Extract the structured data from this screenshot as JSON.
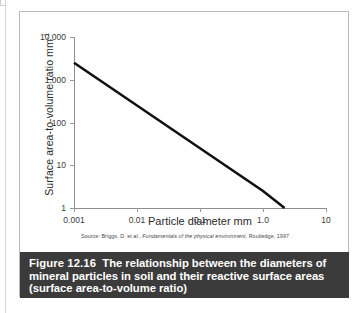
{
  "figure": {
    "caption_label": "Figure 12.16",
    "caption_text": "The relationship between the diameters of mineral particles in soil and their reactive surface areas (surface area-to-volume ratio)",
    "source_prefix": "Source: Briggs, D. et al., ",
    "source_italic": "Fundamentals of the physical environment",
    "source_suffix": ", Routledge, 1997"
  },
  "chart_data": {
    "type": "line",
    "title": "",
    "xlabel": "Particle diameter mm",
    "ylabel": "Surface area-to-volume ratio mm",
    "ylabel_superscript": "-1",
    "xscale": "log",
    "yscale": "log",
    "xlim": [
      0.001,
      10
    ],
    "ylim": [
      1,
      10000
    ],
    "xticks": [
      0.001,
      0.01,
      0.1,
      1,
      10
    ],
    "xticklabels": [
      "0.001",
      "0.01",
      "0.1",
      "1.0",
      "10"
    ],
    "yticks": [
      1,
      10,
      100,
      1000,
      10000
    ],
    "yticklabels": [
      "1",
      "10",
      "100",
      "1,000",
      "10,000"
    ],
    "grid": false,
    "legend": "none",
    "series": [
      {
        "name": "surface area-to-volume ratio",
        "x": [
          0.001,
          0.01,
          0.1,
          1.0,
          2.2
        ],
        "y": [
          2500,
          250,
          25,
          2.5,
          1
        ]
      }
    ]
  },
  "axis_colors": {
    "axis_line": "#8e8e8e",
    "data_line": "#111111",
    "caption_bg": "#3b3b3b",
    "caption_fg": "#ffffff"
  }
}
